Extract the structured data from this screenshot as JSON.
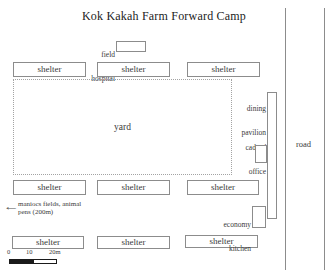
{
  "title": "Kok Kakah Farm Forward Camp",
  "buildings": {
    "field_hospital": {
      "label_line1": "field",
      "label_line2": "hospital"
    },
    "yard": {
      "label": "yard"
    },
    "dining_pavilion": {
      "label_line1": "dining",
      "label_line2": "pavilion"
    },
    "cadres_office": {
      "label_line1": "cadres'",
      "label_line2": "office"
    },
    "economy_kitchen": {
      "label_line1": "economy",
      "label_line2": "kitchen"
    },
    "road": {
      "label": "road"
    }
  },
  "shelters": [
    {
      "row": "top",
      "label": "shelter"
    },
    {
      "row": "top",
      "label": "shelter"
    },
    {
      "row": "top",
      "label": "shelter"
    },
    {
      "row": "middle",
      "label": "shelter"
    },
    {
      "row": "middle",
      "label": "shelter"
    },
    {
      "row": "middle",
      "label": "shelter"
    },
    {
      "row": "bottom",
      "label": "shelter"
    },
    {
      "row": "bottom",
      "label": "shelter"
    },
    {
      "row": "bottom",
      "label": "shelter"
    }
  ],
  "annotation": {
    "arrow": "left-arrow",
    "line1": "maniocs fields, animal",
    "line2": "pens (200m)"
  },
  "scale_bar": {
    "tick0": "0",
    "tick10": "10",
    "tick20": "20m"
  },
  "colors": {
    "line": "#8c8c8c",
    "yard_border": "#a3a3a3",
    "text": "#3a3a3a",
    "title_text": "#1c1c1c",
    "scale_fill": "#1a1a1a",
    "background": "#ffffff"
  }
}
